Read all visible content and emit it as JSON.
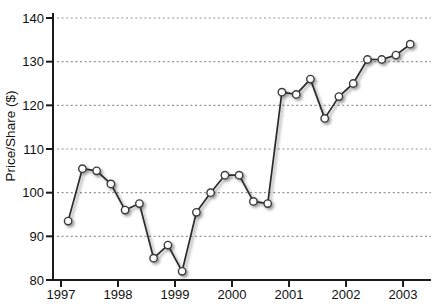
{
  "chart_data": {
    "type": "line",
    "title": "",
    "xlabel": "",
    "ylabel": "Price/Share ($)",
    "legend": "none",
    "grid": "horizontal-dotted",
    "xlim": [
      1996.86,
      2003.49
    ],
    "ylim": [
      80,
      140
    ],
    "xticks": [
      1997,
      1998,
      1999,
      2000,
      2001,
      2002,
      2003
    ],
    "yticks": [
      80,
      90,
      100,
      110,
      120,
      130,
      140
    ],
    "gridline_values": [
      90,
      100,
      110,
      120,
      130,
      140
    ],
    "series": [
      {
        "name": "Price per Share",
        "x": [
          1997.125,
          1997.375,
          1997.625,
          1997.875,
          1998.125,
          1998.375,
          1998.625,
          1998.875,
          1999.125,
          1999.375,
          1999.625,
          1999.875,
          2000.125,
          2000.375,
          2000.625,
          2000.875,
          2001.125,
          2001.375,
          2001.625,
          2001.875,
          2002.125,
          2002.375,
          2002.625,
          2002.875,
          2003.125
        ],
        "point_labels": [
          "Q1 1997",
          "Q2 1997",
          "Q3 1997",
          "Q4 1997",
          "Q1 1998",
          "Q2 1998",
          "Q3 1998",
          "Q4 1998",
          "Q1 1999",
          "Q2 1999",
          "Q3 1999",
          "Q4 1999",
          "Q1 2000",
          "Q2 2000",
          "Q3 2000",
          "Q4 2000",
          "Q1 2001",
          "Q2 2001",
          "Q3 2001",
          "Q4 2001",
          "Q1 2002",
          "Q2 2002",
          "Q3 2002",
          "Q4 2002",
          "Q1 2003"
        ],
        "values": [
          93.5,
          105.5,
          105,
          102,
          96,
          97.5,
          85,
          88,
          82,
          95.5,
          100,
          104,
          104,
          98,
          97.5,
          123,
          122.5,
          126,
          117,
          122,
          125,
          130.5,
          130.5,
          131.5,
          134
        ]
      }
    ],
    "style": {
      "background": "#ffffff",
      "axis_color": "#1a1a1a",
      "grid_color": "#949494",
      "line_color": "#2b2b2b",
      "marker": "circle-open",
      "marker_fill": "#ffffff",
      "marker_stroke": "#3c3c3c",
      "shadow": true
    }
  }
}
